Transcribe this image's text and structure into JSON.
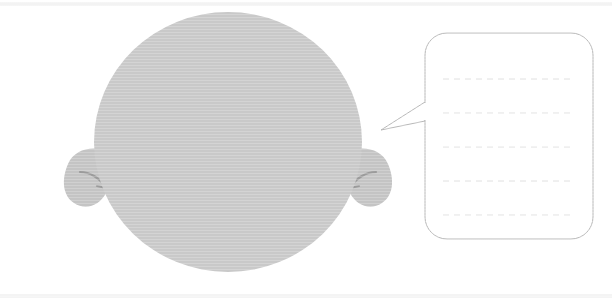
{
  "canvas": {
    "width": 612,
    "height": 305,
    "background_color": "#ffffff",
    "title": "Silhouette head with blank lined speech bubble"
  },
  "bands": [
    {
      "name": "top-edge-band",
      "y": 2,
      "height": 4,
      "color": "#f3f3f3"
    },
    {
      "name": "bottom-edge-band",
      "y": 294,
      "height": 4,
      "color": "#f4f4f4"
    }
  ],
  "figure": {
    "head": {
      "label": "head",
      "shape": "ellipse",
      "cx": 228,
      "cy": 142,
      "rx": 134,
      "ry": 130,
      "fill_color": "#c9c9c9"
    },
    "left_ear": {
      "label": "left-ear",
      "fill_color": "#c4c4c4",
      "inner_fold_color": "#9b9b9b",
      "x": 64,
      "y": 148,
      "width": 40,
      "height": 58
    },
    "right_ear": {
      "label": "right-ear",
      "fill_color": "#c4c4c4",
      "inner_fold_color": "#9b9b9b",
      "x": 352,
      "y": 148,
      "width": 40,
      "height": 58
    }
  },
  "speech_bubble": {
    "label": "speech-bubble",
    "body": {
      "x": 425,
      "y": 33,
      "width": 168,
      "height": 206,
      "corner_radius": 22,
      "fill_color": "#ffffff",
      "stroke_color": "#b8b8b8",
      "stroke_width": 1
    },
    "tail": {
      "label": "speech-bubble-tail",
      "points": "425,102 381,130 425,121",
      "stroke_color": "#b8b8b8",
      "fill_color": "#ffffff"
    },
    "writing_lines": {
      "label": "writing-lines",
      "count": 5,
      "x_start": 443,
      "x_end": 575,
      "y_positions": [
        79,
        113,
        147,
        181,
        215
      ],
      "color": "#e0e0e0",
      "dash_pattern": "6 5",
      "stroke_width": 1,
      "text": ""
    }
  }
}
